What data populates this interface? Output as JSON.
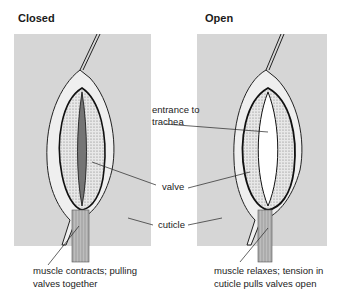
{
  "figure": {
    "panels": [
      {
        "id": "closed",
        "title": "Closed",
        "state": "closed",
        "caption": [
          "muscle contracts; pulling",
          "valves together"
        ]
      },
      {
        "id": "open",
        "title": "Open",
        "state": "open",
        "caption": [
          "muscle relaxes; tension in",
          "cuticle pulls valves open"
        ]
      }
    ],
    "shared_labels": {
      "entrance": [
        "entrance to",
        "trachea"
      ],
      "valve": "valve",
      "cuticle": "cuticle"
    },
    "colors": {
      "background": "#d6d6d6",
      "outline": "#1a1a1a",
      "tissue": "#f2f2f2",
      "stipple": "#8a8a8a"
    }
  }
}
